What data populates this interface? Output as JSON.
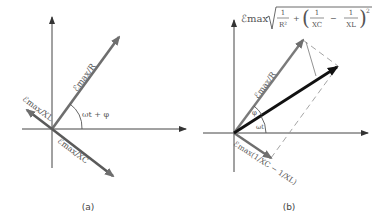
{
  "panels": [
    {
      "caption": "(a)",
      "vectors": [
        {
          "label": "ℰmax/R"
        },
        {
          "label": "ℰmax/XL"
        },
        {
          "label": "ℰmax/XC"
        }
      ],
      "angle_label": "ωt + φ"
    },
    {
      "caption": "(b)",
      "resultant_label": {
        "prefix": "ℰmax",
        "term1_num": "1",
        "term1_den": "R²",
        "plus": "+",
        "term2_num": "1",
        "term2_den": "XC",
        "minus": "−",
        "term3_num": "1",
        "term3_den": "XL",
        "power": "2"
      },
      "vectors": [
        {
          "label": "ℰmax/R"
        },
        {
          "label": "ℰmax(1/XC − 1/XL)"
        }
      ],
      "phi_label": "φ",
      "angle_label": "ωt"
    }
  ],
  "colors": {
    "axis": "#444444",
    "vector": "#6e6e6e",
    "resultant": "#111111",
    "dashed": "#9a9a9a"
  }
}
